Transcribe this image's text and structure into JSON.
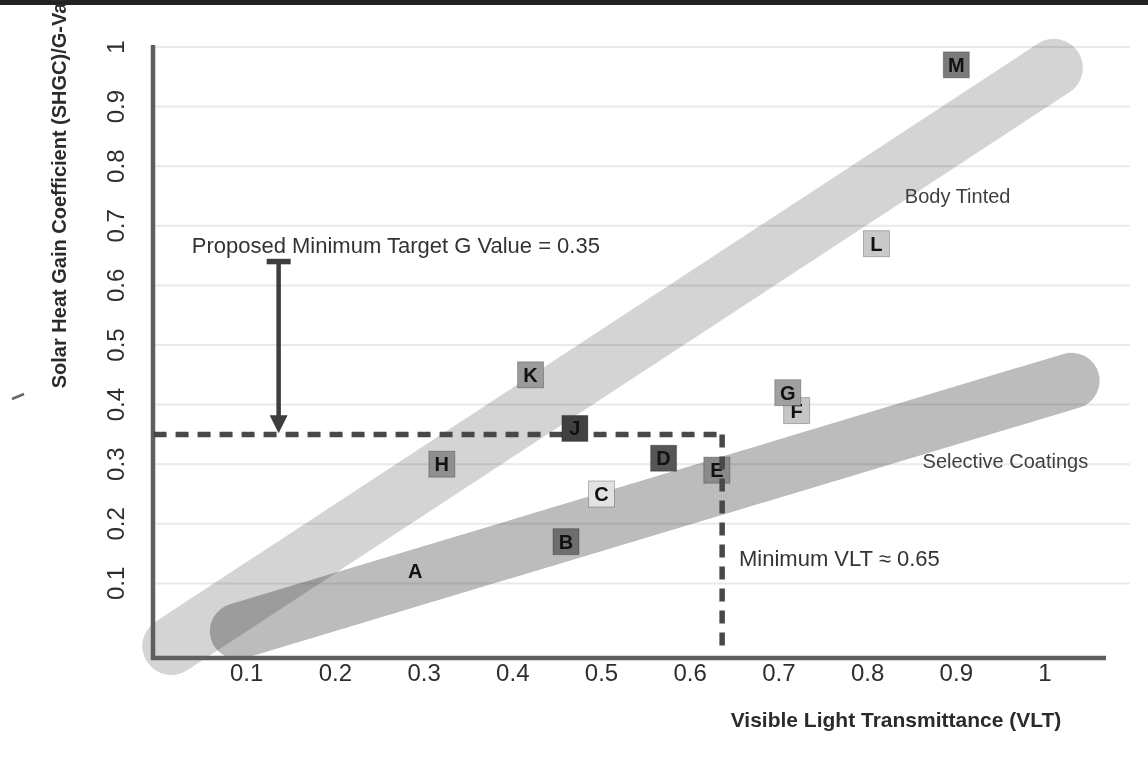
{
  "chart_data": {
    "type": "scatter",
    "title": "",
    "xlabel": "Visible Light Transmittance (VLT)",
    "ylabel": "Solar Heat Gain Coefficient (SHGC)/G-Value",
    "xlim": [
      0,
      1.08
    ],
    "ylim": [
      0,
      1.04
    ],
    "x_ticks": [
      0.1,
      0.2,
      0.3,
      0.4,
      0.5,
      0.6,
      0.7,
      0.8,
      0.9,
      1
    ],
    "y_ticks": [
      0.1,
      0.2,
      0.3,
      0.4,
      0.5,
      0.6,
      0.7,
      0.8,
      0.9,
      1
    ],
    "grid": "horizontal-faint",
    "legend_position": "none",
    "points": [
      {
        "label": "A",
        "x": 0.29,
        "y": 0.12,
        "square": false,
        "color": null
      },
      {
        "label": "B",
        "x": 0.46,
        "y": 0.17,
        "square": true,
        "color": "#6e6e6e"
      },
      {
        "label": "C",
        "x": 0.5,
        "y": 0.25,
        "square": true,
        "color": "#e2e2e2"
      },
      {
        "label": "D",
        "x": 0.57,
        "y": 0.31,
        "square": true,
        "color": "#565656"
      },
      {
        "label": "E",
        "x": 0.63,
        "y": 0.29,
        "square": true,
        "color": "#8a8a8a"
      },
      {
        "label": "F",
        "x": 0.72,
        "y": 0.39,
        "square": true,
        "color": "#c6c6c6"
      },
      {
        "label": "G",
        "x": 0.71,
        "y": 0.42,
        "square": true,
        "color": "#a0a0a0"
      },
      {
        "label": "H",
        "x": 0.32,
        "y": 0.3,
        "square": true,
        "color": "#8f8f8f"
      },
      {
        "label": "J",
        "x": 0.47,
        "y": 0.36,
        "square": true,
        "color": "#404040"
      },
      {
        "label": "K",
        "x": 0.42,
        "y": 0.45,
        "square": true,
        "color": "#9b9b9b"
      },
      {
        "label": "L",
        "x": 0.81,
        "y": 0.67,
        "square": true,
        "color": "#c9c9c9"
      },
      {
        "label": "M",
        "x": 0.9,
        "y": 0.97,
        "square": true,
        "color": "#7a7a7a"
      }
    ],
    "bands": [
      {
        "name": "Body Tinted",
        "from": [
          0.015,
          -0.005
        ],
        "to": [
          1.01,
          0.965
        ],
        "color": "#d4d4d4",
        "width": 58,
        "label_pos": [
          0.842,
          0.738
        ]
      },
      {
        "name": "Selective Coatings",
        "from": [
          0.09,
          0.02
        ],
        "to": [
          1.03,
          0.44
        ],
        "color": "#bcbcbc",
        "width": 56,
        "label_pos": [
          0.862,
          0.294
        ]
      }
    ],
    "annotations": [
      {
        "id": "target-g",
        "text": "Proposed Minimum Target G Value = 0.35",
        "x": 0.038,
        "y": 0.655
      },
      {
        "id": "min-vlt",
        "text": "Minimum VLT ≈ 0.65",
        "x": 0.655,
        "y": 0.13
      }
    ],
    "reference_lines": {
      "horizontal": {
        "value": 0.35,
        "from_x": -0.005,
        "to_x": 0.636
      },
      "vertical": {
        "value": 0.636,
        "from_y": -0.012,
        "to_y": 0.35
      }
    },
    "arrow": {
      "x": 0.136,
      "from_y": 0.64,
      "to_y": 0.352
    }
  },
  "colors": {
    "background": "#ffffff",
    "top_edge": "#222222",
    "axis": "#5f5f5f",
    "grid": "#e9e9e9",
    "tick_text": "#2e2e2e",
    "dashed_line": "#484848",
    "arrow": "#3d3d3d",
    "point_letter": "#111111",
    "square_border": "rgba(0,0,0,0.25)"
  }
}
